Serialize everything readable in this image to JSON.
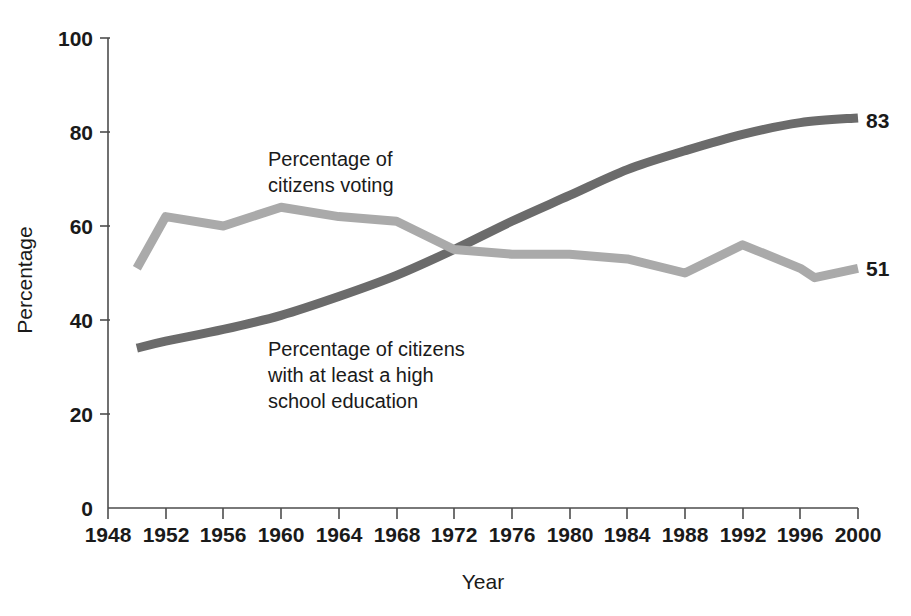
{
  "chart_data": {
    "type": "line",
    "title": "",
    "xlabel": "Year",
    "ylabel": "Percentage",
    "xlim": [
      1948,
      2000
    ],
    "ylim": [
      0,
      100
    ],
    "grid": false,
    "legend_position": "inline-annotations",
    "x_ticks": [
      "1948",
      "1952",
      "1956",
      "1960",
      "1964",
      "1968",
      "1972",
      "1976",
      "1980",
      "1984",
      "1988",
      "1992",
      "1996",
      "2000"
    ],
    "y_ticks": [
      "0",
      "20",
      "40",
      "60",
      "80",
      "100"
    ],
    "x": [
      1950,
      1952,
      1956,
      1960,
      1964,
      1968,
      1972,
      1976,
      1980,
      1984,
      1988,
      1992,
      1996,
      1997,
      2000
    ],
    "series": [
      {
        "name": "Percentage of citizens voting",
        "color": "#aaaaaa",
        "x": [
          1950,
          1952,
          1956,
          1960,
          1964,
          1968,
          1972,
          1976,
          1980,
          1984,
          1988,
          1992,
          1996,
          1997,
          2000
        ],
        "values": [
          51,
          62,
          60,
          64,
          62,
          61,
          55,
          54,
          54,
          53,
          50,
          56,
          51,
          49,
          51
        ],
        "end_label": "51"
      },
      {
        "name": "Percentage of citizens with at least a high school education",
        "color": "#6b6b6b",
        "x": [
          1950,
          1952,
          1956,
          1960,
          1964,
          1968,
          1972,
          1976,
          1980,
          1984,
          1988,
          1992,
          1996,
          2000
        ],
        "values": [
          34,
          35.5,
          38,
          41,
          45,
          49.5,
          55,
          61,
          66.5,
          72,
          76,
          79.5,
          82,
          83
        ],
        "end_label": "83"
      }
    ],
    "annotations": [
      {
        "id": "voting-annotation",
        "lines": [
          "Percentage of",
          "citizens voting"
        ],
        "x": 1962,
        "y": 73
      },
      {
        "id": "education-annotation",
        "lines": [
          "Percentage of citizens",
          "with at least a high",
          "school education"
        ],
        "x": 1962,
        "y": 33
      }
    ]
  },
  "labels": {
    "y_axis_title": "Percentage",
    "x_axis_title": "Year",
    "voting_line_1": "Percentage of",
    "voting_line_2": "citizens voting",
    "education_line_1": "Percentage of citizens",
    "education_line_2": "with at least a high",
    "education_line_3": "school education",
    "voting_end_value": "51",
    "education_end_value": "83",
    "y0": "0",
    "y20": "20",
    "y40": "40",
    "y60": "60",
    "y80": "80",
    "y100": "100",
    "x1948": "1948",
    "x1952": "1952",
    "x1956": "1956",
    "x1960": "1960",
    "x1964": "1964",
    "x1968": "1968",
    "x1972": "1972",
    "x1976": "1976",
    "x1980": "1980",
    "x1984": "1984",
    "x1988": "1988",
    "x1992": "1992",
    "x1996": "1996",
    "x2000": "2000"
  },
  "colors": {
    "voting_series": "#aaaaaa",
    "education_series": "#6b6b6b",
    "axis": "#4d4d4d",
    "text": "#1a1a1a",
    "background": "#ffffff"
  }
}
